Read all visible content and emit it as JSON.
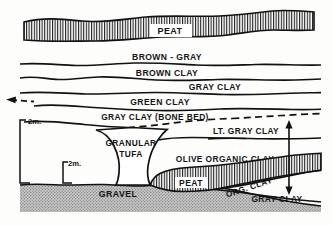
{
  "figure": {
    "type": "geological-cross-section",
    "background_color": "#fdfdfc",
    "line_color": "#111111",
    "units": [
      {
        "id": "peat-upper",
        "label": "PEAT",
        "fill_pattern": "vertical-hatch",
        "fill_color": "#ffffff",
        "label_x": 170,
        "label_y": 31,
        "font_size": 9.0
      },
      {
        "id": "brown-gray",
        "label": "BROWN - GRAY",
        "fill_pattern": "none",
        "fill_color": "#ffffff",
        "label_x": 167,
        "label_y": 59,
        "font_size": 8.6
      },
      {
        "id": "brown-clay",
        "label": "BROWN CLAY",
        "fill_pattern": "none",
        "fill_color": "#ffffff",
        "label_x": 167,
        "label_y": 75,
        "font_size": 8.6
      },
      {
        "id": "gray-clay-upper",
        "label": "GRAY CLAY",
        "fill_pattern": "none",
        "fill_color": "#ffffff",
        "label_x": 215,
        "label_y": 88,
        "font_size": 8.6
      },
      {
        "id": "green-clay",
        "label": "GREEN CLAY",
        "fill_pattern": "none",
        "fill_color": "#ffffff",
        "label_x": 160,
        "label_y": 104,
        "font_size": 8.6
      },
      {
        "id": "gray-clay-bone-bed",
        "label": "GRAY CLAY (BONE BED)",
        "fill_pattern": "none",
        "fill_color": "#ffffff",
        "label_x": 155,
        "label_y": 120,
        "font_size": 8.4
      },
      {
        "id": "lt-gray-clay",
        "label": "LT. GRAY CLAY",
        "fill_pattern": "none",
        "fill_color": "#ffffff",
        "label_x": 243,
        "label_y": 133,
        "font_size": 8.4
      },
      {
        "id": "granular-tufa",
        "label_line1": "GRANULAR",
        "label_line2": "TUFA",
        "fill_pattern": "none",
        "fill_color": "#ffffff",
        "label_x": 131,
        "label_y": 143,
        "font_size": 8.4
      },
      {
        "id": "olive-organic-clay",
        "label": "OLIVE ORGANIC CLAY",
        "fill_pattern": "none",
        "fill_color": "#ffffff",
        "label_x": 225,
        "label_y": 159,
        "font_size": 8.4
      },
      {
        "id": "peat-lower",
        "label": "PEAT",
        "fill_pattern": "vertical-hatch",
        "fill_color": "#ffffff",
        "label_x": 190,
        "label_y": 182,
        "font_size": 8.6
      },
      {
        "id": "org-clay",
        "label": "ORG. CLAY",
        "fill_pattern": "none",
        "fill_color": "#ffffff",
        "label_x": 250,
        "label_y": 190,
        "rotation": -18,
        "font_size": 8.2
      },
      {
        "id": "gray-clay-lower",
        "label": "GRAY CLAY",
        "fill_pattern": "none",
        "fill_color": "#ffffff",
        "label_x": 274,
        "label_y": 199,
        "font_size": 8.4
      },
      {
        "id": "gravel",
        "label": "GRAVEL",
        "fill_pattern": "stipple",
        "fill_color": "#bcbcbc",
        "label_x": 118,
        "label_y": 197,
        "font_size": 8.8
      }
    ],
    "scale_bars": [
      {
        "id": "scale-bar-outer",
        "label": "2m.",
        "label_x": 28,
        "label_y": 124,
        "font_size": 7.6,
        "bracket": "left-vertical",
        "x": 20,
        "y_top": 120,
        "y_bottom": 183,
        "tick_length": 6
      },
      {
        "id": "scale-bar-inner",
        "label": "2m.",
        "label_x": 69,
        "label_y": 166,
        "font_size": 7.6,
        "bracket": "left-vertical",
        "x": 63,
        "y_top": 162,
        "y_bottom": 183,
        "tick_length": 5
      }
    ],
    "arrows": [
      {
        "id": "thickness-arrow-right",
        "style": "double-headed-vertical",
        "x": 289,
        "y_top": 122,
        "y_bottom": 193,
        "label": ""
      },
      {
        "id": "bone-bed-arrow-left",
        "style": "single-headed-left",
        "x_tip": 8,
        "y": 99,
        "label": ""
      }
    ],
    "dashed_horizons": [
      {
        "id": "bone-bed-dashed-left",
        "description": "dashed continuation of bone bed horizon at left margin"
      },
      {
        "id": "bone-bed-dashed-right",
        "description": "dashed continuation of bone bed horizon at right margin"
      },
      {
        "id": "tufa-top-dashed",
        "description": "dashed contact across top of granular tufa"
      }
    ]
  }
}
